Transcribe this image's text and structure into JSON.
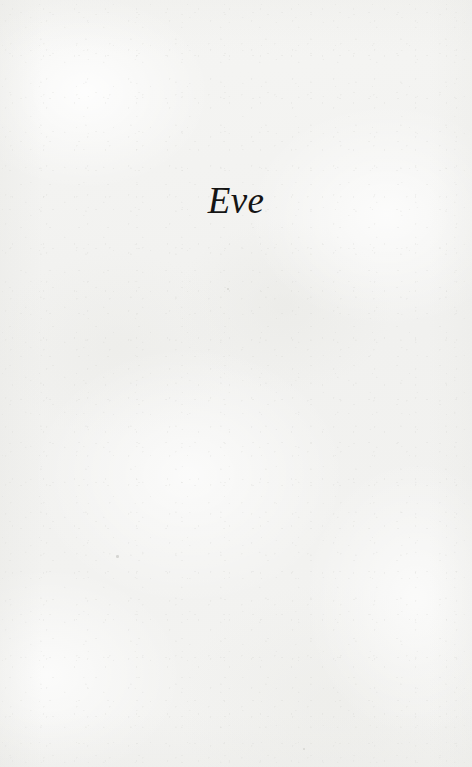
{
  "page": {
    "kind": "book-part-title-page",
    "width": 472,
    "height": 767,
    "paper_color": "#f3f3f1",
    "ink_color": "#151515"
  },
  "title": {
    "text": "Eve",
    "style": "italic-serif",
    "align": "center"
  },
  "body": {
    "text": ""
  },
  "marks": [
    {
      "name": "paper-speck-upper",
      "x": 227,
      "y": 288,
      "size": 2.2,
      "opacity": 0.3
    },
    {
      "name": "paper-speck-left",
      "x": 116,
      "y": 555,
      "size": 2.6,
      "opacity": 0.34
    },
    {
      "name": "paper-speck-lower",
      "x": 303,
      "y": 748,
      "size": 2.0,
      "opacity": 0.28
    }
  ]
}
